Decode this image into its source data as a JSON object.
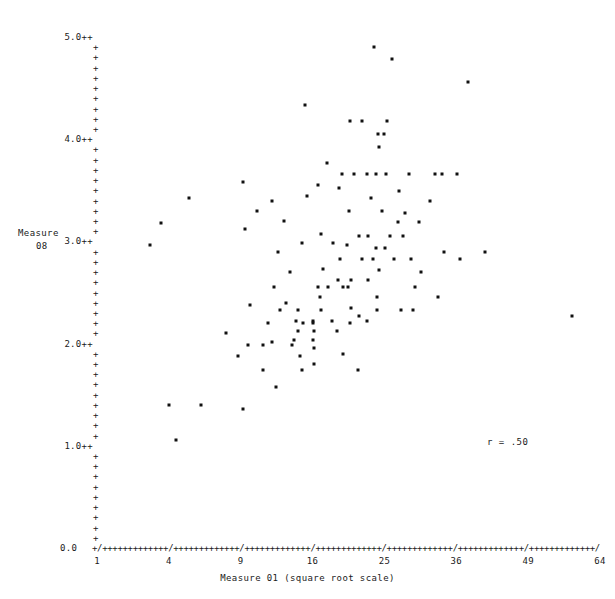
{
  "chart_data": {
    "type": "scatter",
    "title": "",
    "xlabel": "Measure 01 (square root scale)",
    "ylabel": "Measure 08",
    "ylabel_lines": [
      "Measure",
      "08"
    ],
    "annotation": "r = .50",
    "correlation": 0.5,
    "xscale": "square-root",
    "xlim": [
      1,
      64
    ],
    "ylim": [
      0.0,
      5.0
    ],
    "grid": false,
    "legend": null,
    "axis_glyph": "+",
    "tick_glyph": "/",
    "point_glyph": "*",
    "xticks": [
      1,
      4,
      9,
      16,
      25,
      36,
      49,
      64
    ],
    "xtick_labels": [
      "1",
      "4",
      "9",
      "16",
      "25",
      "36",
      "49",
      "64"
    ],
    "yticks": [
      0.0,
      1.0,
      2.0,
      3.0,
      4.0,
      5.0
    ],
    "ytick_labels": [
      "0.0",
      "1.0++",
      "2.0++",
      "3.0++",
      "4.0++",
      "5.0++"
    ],
    "y_minor_count_between": 9,
    "n_points": 116,
    "points": [
      [
        23.6,
        4.9
      ],
      [
        26.0,
        4.78
      ],
      [
        38.0,
        4.56
      ],
      [
        15.2,
        4.33
      ],
      [
        20.5,
        4.18
      ],
      [
        22.0,
        4.18
      ],
      [
        25.4,
        4.18
      ],
      [
        24.1,
        4.05
      ],
      [
        24.9,
        4.05
      ],
      [
        24.2,
        3.92
      ],
      [
        17.6,
        3.77
      ],
      [
        19.4,
        3.66
      ],
      [
        21.0,
        3.66
      ],
      [
        22.6,
        3.66
      ],
      [
        23.9,
        3.66
      ],
      [
        25.2,
        3.66
      ],
      [
        28.6,
        3.66
      ],
      [
        32.6,
        3.66
      ],
      [
        33.6,
        3.66
      ],
      [
        36.2,
        3.66
      ],
      [
        9.2,
        3.58
      ],
      [
        16.6,
        3.55
      ],
      [
        19.1,
        3.52
      ],
      [
        27.0,
        3.49
      ],
      [
        5.2,
        3.42
      ],
      [
        11.8,
        3.4
      ],
      [
        20.3,
        3.3
      ],
      [
        24.6,
        3.3
      ],
      [
        28.0,
        3.28
      ],
      [
        26.9,
        3.19
      ],
      [
        30.0,
        3.19
      ],
      [
        3.6,
        3.18
      ],
      [
        9.4,
        3.12
      ],
      [
        17.0,
        3.07
      ],
      [
        21.6,
        3.05
      ],
      [
        22.8,
        3.05
      ],
      [
        25.8,
        3.05
      ],
      [
        27.6,
        3.05
      ],
      [
        3.0,
        2.96
      ],
      [
        20.1,
        2.96
      ],
      [
        23.9,
        2.94
      ],
      [
        25.1,
        2.94
      ],
      [
        12.4,
        2.9
      ],
      [
        34.0,
        2.9
      ],
      [
        41.0,
        2.9
      ],
      [
        19.2,
        2.83
      ],
      [
        22.0,
        2.83
      ],
      [
        23.4,
        2.83
      ],
      [
        26.4,
        2.83
      ],
      [
        28.8,
        2.83
      ],
      [
        36.6,
        2.83
      ],
      [
        17.2,
        2.73
      ],
      [
        24.2,
        2.72
      ],
      [
        30.4,
        2.7
      ],
      [
        19.0,
        2.62
      ],
      [
        20.6,
        2.62
      ],
      [
        16.6,
        2.55
      ],
      [
        17.8,
        2.55
      ],
      [
        19.6,
        2.55
      ],
      [
        20.2,
        2.55
      ],
      [
        16.8,
        2.46
      ],
      [
        24.0,
        2.46
      ],
      [
        33.0,
        2.46
      ],
      [
        9.8,
        2.38
      ],
      [
        20.6,
        2.35
      ],
      [
        12.6,
        2.33
      ],
      [
        14.4,
        2.33
      ],
      [
        17.0,
        2.33
      ],
      [
        24.0,
        2.33
      ],
      [
        27.4,
        2.33
      ],
      [
        21.6,
        2.27
      ],
      [
        58.0,
        2.27
      ],
      [
        14.2,
        2.22
      ],
      [
        16.0,
        2.22
      ],
      [
        18.2,
        2.22
      ],
      [
        22.6,
        2.22
      ],
      [
        11.4,
        2.2
      ],
      [
        15.0,
        2.2
      ],
      [
        16.0,
        2.2
      ],
      [
        20.4,
        2.2
      ],
      [
        14.4,
        2.12
      ],
      [
        16.2,
        2.12
      ],
      [
        7.8,
        2.1
      ],
      [
        14.0,
        2.04
      ],
      [
        16.0,
        2.04
      ],
      [
        9.6,
        1.99
      ],
      [
        11.0,
        1.99
      ],
      [
        13.8,
        1.99
      ],
      [
        16.2,
        1.96
      ],
      [
        8.8,
        1.88
      ],
      [
        14.6,
        1.88
      ],
      [
        16.2,
        1.8
      ],
      [
        11.0,
        1.74
      ],
      [
        14.8,
        1.74
      ],
      [
        21.4,
        1.74
      ],
      [
        12.2,
        1.58
      ],
      [
        4.0,
        1.4
      ],
      [
        6.0,
        1.4
      ],
      [
        9.2,
        1.36
      ],
      [
        4.4,
        1.06
      ],
      [
        10.4,
        3.3
      ],
      [
        13.0,
        3.2
      ],
      [
        14.8,
        2.98
      ],
      [
        18.4,
        2.98
      ],
      [
        12.0,
        2.55
      ],
      [
        13.2,
        2.4
      ],
      [
        18.8,
        2.12
      ],
      [
        11.8,
        2.02
      ],
      [
        19.6,
        1.9
      ],
      [
        22.8,
        2.62
      ],
      [
        29.4,
        2.55
      ],
      [
        15.4,
        3.44
      ],
      [
        31.8,
        3.4
      ],
      [
        13.6,
        2.7
      ],
      [
        29.2,
        2.33
      ],
      [
        23.1,
        3.42
      ]
    ]
  },
  "annotations": {
    "correlation_text": "r = .50"
  }
}
